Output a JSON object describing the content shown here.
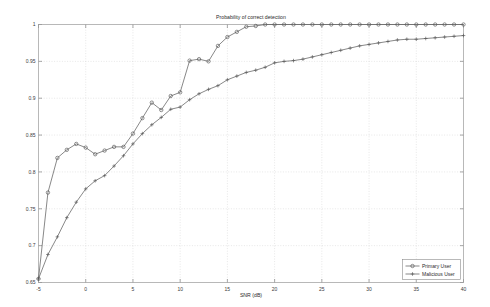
{
  "chart_data": {
    "type": "line",
    "title": "Probability of correct detection",
    "xlabel": "SNR (dB)",
    "ylabel": "",
    "xlim": [
      -5,
      40
    ],
    "ylim": [
      0.65,
      1.0
    ],
    "xticks": [
      -5,
      0,
      5,
      10,
      15,
      20,
      25,
      30,
      35,
      40
    ],
    "xtick_labels": [
      "-5",
      "0",
      "5",
      "10",
      "15",
      "20",
      "25",
      "30",
      "35",
      "40"
    ],
    "yticks": [
      0.65,
      0.7,
      0.75,
      0.8,
      0.85,
      0.9,
      0.95,
      1
    ],
    "ytick_labels": [
      "0.65",
      "0.7",
      "0.75",
      "0.8",
      "0.85",
      "0.9",
      "0.95",
      "1"
    ],
    "grid": true,
    "legend_position": "lower right",
    "x": [
      -5,
      -4,
      -3,
      -2,
      -1,
      0,
      1,
      2,
      3,
      4,
      5,
      6,
      7,
      8,
      9,
      10,
      11,
      12,
      13,
      14,
      15,
      16,
      17,
      18,
      19,
      20,
      21,
      22,
      23,
      24,
      25,
      26,
      27,
      28,
      29,
      30,
      31,
      32,
      33,
      34,
      35,
      36,
      37,
      38,
      39,
      40
    ],
    "series": [
      {
        "name": "Primary User",
        "marker": "circle",
        "values": [
          0.655,
          0.772,
          0.819,
          0.83,
          0.838,
          0.833,
          0.824,
          0.829,
          0.834,
          0.834,
          0.852,
          0.873,
          0.894,
          0.884,
          0.903,
          0.908,
          0.951,
          0.953,
          0.95,
          0.971,
          0.983,
          0.99,
          0.997,
          0.998,
          1.0,
          1.0,
          1.0,
          1.0,
          1.0,
          1.0,
          1.0,
          1.0,
          1.0,
          1.0,
          1.0,
          1.0,
          1.0,
          1.0,
          1.0,
          1.0,
          1.0,
          1.0,
          1.0,
          1.0,
          1.0,
          1.0
        ]
      },
      {
        "name": "Malicious User",
        "marker": "plus",
        "values": [
          0.655,
          0.688,
          0.712,
          0.738,
          0.759,
          0.777,
          0.788,
          0.795,
          0.808,
          0.822,
          0.838,
          0.852,
          0.864,
          0.874,
          0.885,
          0.888,
          0.898,
          0.906,
          0.912,
          0.917,
          0.925,
          0.93,
          0.935,
          0.938,
          0.942,
          0.948,
          0.95,
          0.951,
          0.953,
          0.956,
          0.959,
          0.962,
          0.965,
          0.968,
          0.971,
          0.973,
          0.975,
          0.977,
          0.979,
          0.98,
          0.98,
          0.981,
          0.982,
          0.983,
          0.984,
          0.985
        ]
      }
    ]
  }
}
